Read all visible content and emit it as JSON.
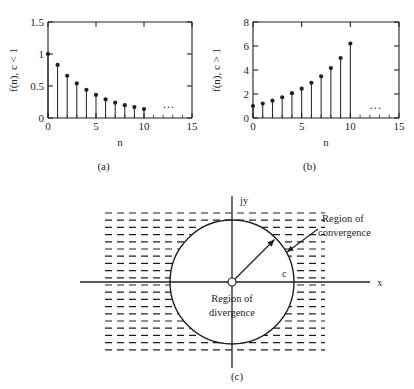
{
  "figure": {
    "panels": [
      {
        "id": "a",
        "caption": "(a)",
        "ylabel": "f(n), c < 1",
        "xlabel": "n"
      },
      {
        "id": "b",
        "caption": "(b)",
        "ylabel": "f(n), c > 1",
        "xlabel": "n"
      },
      {
        "id": "c",
        "caption": "(c)"
      }
    ]
  },
  "diagram": {
    "axis_y_label": "jy",
    "axis_x_label": "x",
    "radius_label": "c",
    "inner_label_line1": "Region of",
    "inner_label_line2": "divergence",
    "annotation_line1": "Region of",
    "annotation_line2": "convergence"
  },
  "ellipsis": "...",
  "chart_data": [
    {
      "type": "stem",
      "id": "a",
      "title": "",
      "xlabel": "n",
      "ylabel": "f(n), c < 1",
      "xlim": [
        0,
        15
      ],
      "ylim": [
        0,
        1.5
      ],
      "xticks": [
        0,
        5,
        10,
        15
      ],
      "yticks": [
        0,
        0.5,
        1,
        1.5
      ],
      "xtick_labels": [
        "0",
        "5",
        "10",
        "15"
      ],
      "ytick_labels": [
        "0",
        "0.5",
        "1",
        "1.5"
      ],
      "grid": false,
      "legend": "none",
      "x": [
        0,
        1,
        2,
        3,
        4,
        5,
        6,
        7,
        8,
        9,
        10
      ],
      "values": [
        1.0,
        0.83,
        0.66,
        0.54,
        0.44,
        0.36,
        0.29,
        0.24,
        0.2,
        0.17,
        0.14
      ],
      "annotation": "...",
      "annotation_x": 12.6,
      "annotation_y": 0.15
    },
    {
      "type": "stem",
      "id": "b",
      "title": "",
      "xlabel": "n",
      "ylabel": "f(n), c > 1",
      "xlim": [
        0,
        15
      ],
      "ylim": [
        0,
        8
      ],
      "xticks": [
        0,
        5,
        10,
        15
      ],
      "yticks": [
        0,
        2,
        4,
        6,
        8
      ],
      "xtick_labels": [
        "0",
        "5",
        "10",
        "15"
      ],
      "ytick_labels": [
        "0",
        "2",
        "4",
        "6",
        "8"
      ],
      "grid": false,
      "legend": "none",
      "x": [
        0,
        1,
        2,
        3,
        4,
        5,
        6,
        7,
        8,
        9,
        10
      ],
      "values": [
        1.0,
        1.2,
        1.44,
        1.73,
        2.07,
        2.44,
        2.93,
        3.47,
        4.16,
        5.0,
        6.2
      ],
      "annotation": "...",
      "annotation_x": 12.6,
      "annotation_y": 0.75
    }
  ]
}
